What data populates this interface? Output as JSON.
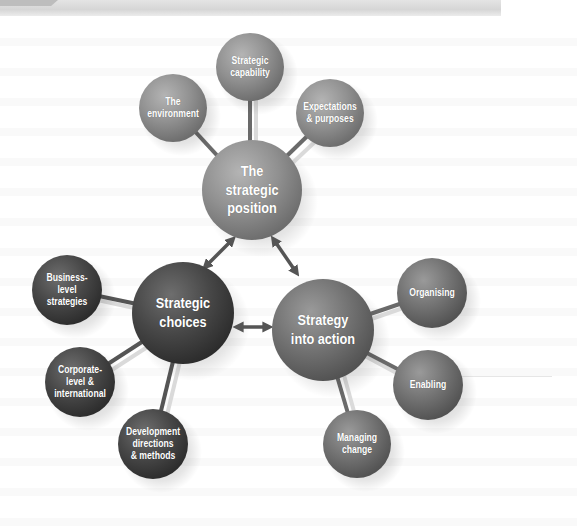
{
  "header": {
    "bar_color": "#d9d9d9",
    "tab_color": "#bdbdbd"
  },
  "colors": {
    "position_fill": "#8f8f8f",
    "choices_fill": "#4a4a4a",
    "action_fill": "#707070",
    "spoke_dark": "#6a6a6a",
    "spoke_light": "#d8d8d8",
    "arrow": "#555555",
    "label_text": "#ffffff"
  },
  "diagram": {
    "hubs": [
      {
        "id": "position",
        "label": "The\nstrategic\nposition",
        "cx": 252,
        "cy": 190,
        "r": 50
      },
      {
        "id": "choices",
        "label": "Strategic\nchoices",
        "cx": 183,
        "cy": 313,
        "r": 51
      },
      {
        "id": "action",
        "label": "Strategy\ninto action",
        "cx": 323,
        "cy": 330,
        "r": 51
      }
    ],
    "satellites": {
      "position": [
        {
          "label": "The\nenvironment",
          "cx": 173,
          "cy": 108,
          "r": 34
        },
        {
          "label": "Strategic\ncapability",
          "cx": 250,
          "cy": 67,
          "r": 34
        },
        {
          "label": "Expectations\n& purposes",
          "cx": 330,
          "cy": 113,
          "r": 34
        }
      ],
      "choices": [
        {
          "label": "Business-\nlevel\nstrategies",
          "cx": 67,
          "cy": 290,
          "r": 35
        },
        {
          "label": "Corporate-\nlevel &\ninternational",
          "cx": 80,
          "cy": 382,
          "r": 35
        },
        {
          "label": "Development\ndirections\n& methods",
          "cx": 153,
          "cy": 444,
          "r": 35
        }
      ],
      "action": [
        {
          "label": "Organising",
          "cx": 432,
          "cy": 293,
          "r": 35
        },
        {
          "label": "Enabling",
          "cx": 428,
          "cy": 385,
          "r": 35
        },
        {
          "label": "Managing\nchange",
          "cx": 357,
          "cy": 444,
          "r": 34
        }
      ]
    },
    "arrows": [
      {
        "from": "position",
        "to": "choices",
        "type": "double-headed"
      },
      {
        "from": "position",
        "to": "action",
        "type": "double-headed"
      },
      {
        "from": "choices",
        "to": "action",
        "type": "double-headed"
      }
    ]
  }
}
